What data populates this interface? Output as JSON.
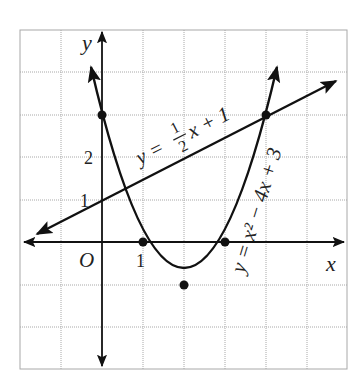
{
  "diagram": {
    "title": "",
    "axes": {
      "x_label": "x",
      "y_label": "y",
      "origin_label": "O",
      "tick_x_1": "1",
      "tick_y_1": "1",
      "tick_y_2": "2"
    },
    "equations": {
      "line": {
        "lhs": "y =",
        "frac_num": "1",
        "frac_den": "2",
        "rhs": "x + 1",
        "full": "y = 1/2 x + 1"
      },
      "parabola": {
        "text": "y = x² − 4x + 3",
        "full": "y = x^2 - 4x + 3"
      }
    },
    "points": [
      {
        "name": "y-intercept-parabola",
        "x": 0,
        "y": 3
      },
      {
        "name": "root-1",
        "x": 1,
        "y": 0
      },
      {
        "name": "root-3",
        "x": 3,
        "y": 0
      },
      {
        "name": "vertex",
        "x": 2,
        "y": -1
      },
      {
        "name": "intersection",
        "x": 4,
        "y": 3
      }
    ],
    "grid": {
      "x_range": [
        -2,
        6
      ],
      "y_range": [
        -3,
        5
      ],
      "step": 1
    },
    "colors": {
      "curve": "#111111",
      "grid": "#a8a8a8",
      "background": "#ffffff"
    }
  }
}
